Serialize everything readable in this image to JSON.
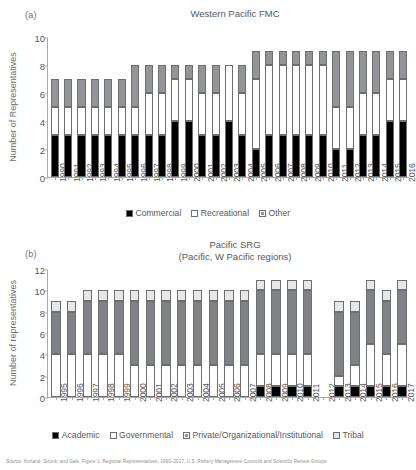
{
  "figure": {
    "caption_partial": "Source: Kurland, Strunk, and Gale, Figure 1. Regional Representatives, 1990–2017, U.S. Fishery Management Councils and Scientific Review Groups"
  },
  "panel_a": {
    "letter": "(a)",
    "title": "Western Pacific FMC",
    "ylabel": "Number of Representatives",
    "legend": [
      {
        "label": "Commercial",
        "style": "solid-black",
        "color": "#000000"
      },
      {
        "label": "Recreational",
        "style": "open-white",
        "color": "#ffffff"
      },
      {
        "label": "Other",
        "style": "hatch-gray",
        "color": "#939598"
      }
    ]
  },
  "panel_b": {
    "letter": "(b)",
    "title_line1": "Pacific SRG",
    "title_line2": "(Pacific, W Pacific regions)",
    "ylabel": "Number of representatives",
    "legend": [
      {
        "label": "Academic",
        "style": "solid-black",
        "color": "#000000"
      },
      {
        "label": "Governmental",
        "style": "open-white",
        "color": "#ffffff"
      },
      {
        "label": "Private/Organizational/Institutional",
        "style": "hatch-gray",
        "color": "#808285"
      },
      {
        "label": "Tribal",
        "style": "open-light",
        "color": "#e6e7e8"
      }
    ]
  },
  "chart_data": [
    {
      "type": "bar",
      "id": "western-pacific-fmc",
      "stacked": true,
      "title": "Western Pacific FMC",
      "xlabel": "",
      "ylabel": "Number of Representatives",
      "ylim": [
        0,
        10
      ],
      "yticks": [
        0,
        2,
        4,
        6,
        8,
        10
      ],
      "grid": false,
      "legend_position": "bottom",
      "categories": [
        "1990",
        "1991",
        "1992",
        "1993",
        "1994",
        "1995",
        "1996",
        "1997",
        "1998",
        "1999",
        "2000",
        "2001",
        "2002",
        "2003",
        "2004",
        "2005",
        "2006",
        "2007",
        "2008",
        "2009",
        "2010",
        "2011",
        "2012",
        "2013",
        "2014",
        "2015",
        "2016"
      ],
      "series": [
        {
          "name": "Commercial",
          "color": "#000000",
          "values": [
            3,
            3,
            3,
            3,
            3,
            3,
            3,
            3,
            3,
            4,
            4,
            3,
            3,
            4,
            3,
            2,
            3,
            3,
            3,
            3,
            3,
            2,
            2,
            3,
            3,
            4,
            4
          ]
        },
        {
          "name": "Recreational",
          "color": "#ffffff",
          "values": [
            2,
            2,
            2,
            2,
            2,
            2,
            2,
            3,
            3,
            3,
            3,
            3,
            3,
            4,
            3,
            5,
            5,
            5,
            5,
            5,
            5,
            3,
            3,
            3,
            3,
            3,
            3
          ]
        },
        {
          "name": "Other",
          "color": "#939598",
          "values": [
            2,
            2,
            2,
            2,
            2,
            2,
            3,
            2,
            2,
            1,
            1,
            2,
            2,
            0,
            2,
            2,
            1,
            1,
            1,
            1,
            1,
            4,
            4,
            3,
            3,
            2,
            2
          ]
        }
      ],
      "totals": [
        7,
        7,
        7,
        7,
        7,
        7,
        8,
        8,
        8,
        8,
        8,
        8,
        8,
        8,
        8,
        9,
        9,
        9,
        9,
        9,
        9,
        9,
        9,
        9,
        9,
        9,
        9
      ]
    },
    {
      "type": "bar",
      "id": "pacific-srg",
      "stacked": true,
      "title": "Pacific SRG (Pacific, W Pacific regions)",
      "xlabel": "",
      "ylabel": "Number of representatives",
      "ylim": [
        0,
        12
      ],
      "yticks": [
        0,
        2,
        4,
        6,
        8,
        10,
        12
      ],
      "grid": false,
      "legend_position": "bottom",
      "categories": [
        "1995",
        "1996",
        "1997",
        "1998",
        "1999",
        "2000",
        "2001",
        "2002",
        "2003",
        "2004",
        "2005",
        "2006",
        "2007",
        "2008",
        "2009",
        "2010",
        "2011",
        "2012",
        "2013",
        "2014",
        "2015",
        "2016",
        "2017"
      ],
      "series": [
        {
          "name": "Academic",
          "color": "#000000",
          "values": [
            0,
            0,
            0,
            0,
            0,
            0,
            0,
            0,
            0,
            0,
            0,
            0,
            0,
            1,
            1,
            1,
            1,
            0,
            1,
            1,
            1,
            1,
            1
          ]
        },
        {
          "name": "Governmental",
          "color": "#ffffff",
          "values": [
            4,
            4,
            4,
            4,
            4,
            3,
            3,
            3,
            3,
            3,
            3,
            3,
            3,
            3,
            3,
            3,
            3,
            0,
            1,
            2,
            4,
            3,
            4
          ]
        },
        {
          "name": "Private/Organizational/Institutional",
          "color": "#808285",
          "values": [
            4,
            4,
            5,
            5,
            5,
            6,
            6,
            6,
            6,
            6,
            6,
            6,
            6,
            6,
            6,
            6,
            6,
            0,
            6,
            5,
            5,
            5,
            5
          ]
        },
        {
          "name": "Tribal",
          "color": "#e6e7e8",
          "values": [
            1,
            1,
            1,
            1,
            1,
            1,
            1,
            1,
            1,
            1,
            1,
            1,
            1,
            1,
            1,
            1,
            1,
            0,
            1,
            1,
            1,
            1,
            1
          ]
        }
      ],
      "totals": [
        9,
        9,
        10,
        10,
        10,
        10,
        10,
        10,
        10,
        10,
        10,
        10,
        10,
        11,
        11,
        11,
        11,
        0,
        9,
        9,
        11,
        10,
        11
      ]
    }
  ]
}
